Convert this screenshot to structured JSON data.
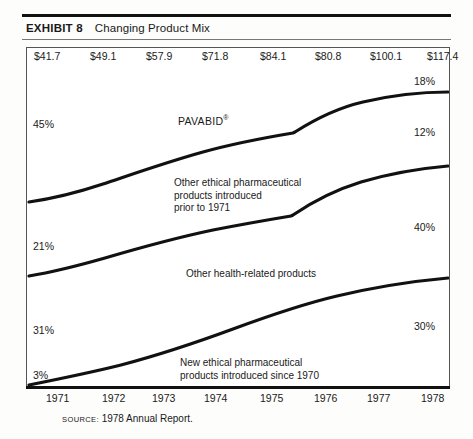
{
  "exhibit": {
    "label": "EXHIBIT 8",
    "title": "Changing Product Mix"
  },
  "source": {
    "keyword": "SOURCE:",
    "text": "1978 Annual Report."
  },
  "chart_data": {
    "type": "area",
    "title": "Changing Product Mix",
    "xlabel": "",
    "ylabel": "",
    "grid": false,
    "legend_position": "inline-band-labels",
    "stacked": true,
    "normalized": true,
    "ylim": [
      0,
      100
    ],
    "categories": [
      "1971",
      "1972",
      "1973",
      "1974",
      "1975",
      "1976",
      "1977",
      "1978"
    ],
    "top_value_labels": [
      "$41.7",
      "$49.1",
      "$57.9",
      "$71.8",
      "$84.1",
      "$80.8",
      "$100.1",
      "$117.4"
    ],
    "top_value_caption": "Net sales ($ millions)",
    "series": [
      {
        "name": "PAVABID®",
        "label_lines": [
          "PAVABID"
        ],
        "start_pct": "45%",
        "end_pct": "18%",
        "values": [
          45,
          null,
          null,
          null,
          null,
          null,
          null,
          18
        ]
      },
      {
        "name": "Other ethical pharmaceutical products introduced prior to 1971",
        "label_lines": [
          "Other ethical pharmaceutical",
          "products introduced",
          "prior to 1971"
        ],
        "start_pct": "21%",
        "end_pct": "12%",
        "values": [
          21,
          null,
          null,
          null,
          null,
          null,
          null,
          12
        ]
      },
      {
        "name": "Other health-related products",
        "label_lines": [
          "Other health-related products"
        ],
        "start_pct": "31%",
        "end_pct": "40%",
        "values": [
          31,
          null,
          null,
          null,
          null,
          null,
          null,
          40
        ]
      },
      {
        "name": "New ethical pharmaceutical products introduced since 1970",
        "label_lines": [
          "New ethical pharmaceutical",
          "products introduced since 1970"
        ],
        "start_pct": "3%",
        "end_pct": "30%",
        "values": [
          3,
          null,
          null,
          null,
          null,
          null,
          null,
          30
        ]
      }
    ]
  },
  "values": [
    {
      "text": "$41.7",
      "x": 8
    },
    {
      "text": "$49.1",
      "x": 64
    },
    {
      "text": "$57.9",
      "x": 120
    },
    {
      "text": "$71.8",
      "x": 176
    },
    {
      "text": "$84.1",
      "x": 234
    },
    {
      "text": "$80.8",
      "x": 289
    },
    {
      "text": "$100.1",
      "x": 344
    },
    {
      "text": "$117.4",
      "x": 401
    }
  ],
  "years": [
    {
      "text": "1971",
      "x": 20
    },
    {
      "text": "1972",
      "x": 76
    },
    {
      "text": "1973",
      "x": 126
    },
    {
      "text": "1974",
      "x": 178
    },
    {
      "text": "1975",
      "x": 234
    },
    {
      "text": "1976",
      "x": 288
    },
    {
      "text": "1977",
      "x": 341
    },
    {
      "text": "1978",
      "x": 395
    }
  ],
  "pct_left": [
    {
      "text": "45%",
      "x": 33,
      "y": 118
    },
    {
      "text": "21%",
      "x": 33,
      "y": 240
    },
    {
      "text": "31%",
      "x": 33,
      "y": 324
    },
    {
      "text": "3%",
      "x": 33,
      "y": 369
    }
  ],
  "pct_right": [
    {
      "text": "18%",
      "x": 414,
      "y": 75
    },
    {
      "text": "12%",
      "x": 414,
      "y": 126
    },
    {
      "text": "40%",
      "x": 414,
      "y": 221
    },
    {
      "text": "30%",
      "x": 414,
      "y": 320
    }
  ],
  "band_labels": {
    "pavabid": {
      "text": "PAVABID",
      "reg": "®",
      "x": 178,
      "y": 112
    },
    "other_ethical_1": {
      "text": "Other ethical pharmaceutical",
      "x": 174,
      "y": 182
    },
    "other_ethical_2": {
      "text": "products introduced",
      "x": 174,
      "y": 194
    },
    "other_ethical_3": {
      "text": "prior to 1971",
      "x": 174,
      "y": 206
    },
    "health_related": {
      "text": "Other health-related products",
      "x": 186,
      "y": 272
    },
    "new_ethical_1": {
      "text": "New ethical pharmaceutical",
      "x": 180,
      "y": 361
    },
    "new_ethical_2": {
      "text": "products introduced since 1970",
      "x": 180,
      "y": 373
    }
  }
}
